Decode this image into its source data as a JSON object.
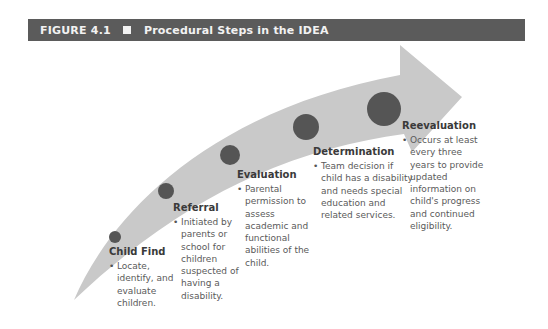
{
  "figure": {
    "label": "FIGURE 4.1",
    "title": "Procedural Steps in the IDEA",
    "square_icon": "filled-square"
  },
  "colors": {
    "header_bg": "#5b5b5b",
    "header_text": "#f2f2f2",
    "arrow_fill": "#c9c9c9",
    "circle_fill": "#555555",
    "title_text": "#3a3a3a",
    "body_text": "#5a5a5a"
  },
  "steps": [
    {
      "title": "Child Find",
      "bullet": "•",
      "description": "Locate, identify, and evaluate children."
    },
    {
      "title": "Referral",
      "bullet": "•",
      "description": "Initiated by parents or school for children suspected of having a disability."
    },
    {
      "title": "Evaluation",
      "bullet": "•",
      "description": "Parental permission to assess academic and functional abilities of the child."
    },
    {
      "title": "Determination",
      "bullet": "•",
      "description": "Team decision if child has a disability and needs special education and related services."
    },
    {
      "title": "Reevaluation",
      "bullet": "•",
      "description": "Occurs at least every three years to provide updated information on child's progress and continued eligibility."
    }
  ]
}
